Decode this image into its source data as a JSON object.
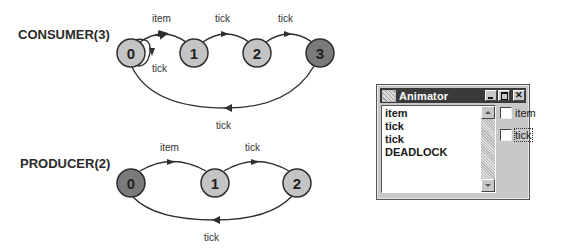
{
  "diagram": {
    "consumer": {
      "label": "CONSUMER(3)",
      "states": [
        {
          "id": "0",
          "fill": "#c4c4c4"
        },
        {
          "id": "1",
          "fill": "#c4c4c4"
        },
        {
          "id": "2",
          "fill": "#c4c4c4"
        },
        {
          "id": "3",
          "fill": "#7a7a7a"
        }
      ],
      "transitions": [
        {
          "from": "0",
          "to": "1",
          "label": "item"
        },
        {
          "from": "1",
          "to": "2",
          "label": "tick"
        },
        {
          "from": "2",
          "to": "3",
          "label": "tick"
        },
        {
          "from": "0",
          "to": "0",
          "label": "tick"
        },
        {
          "from": "3",
          "to": "0",
          "label": "tick"
        }
      ]
    },
    "producer": {
      "label": "PRODUCER(2)",
      "states": [
        {
          "id": "0",
          "fill": "#7a7a7a"
        },
        {
          "id": "1",
          "fill": "#c4c4c4"
        },
        {
          "id": "2",
          "fill": "#c4c4c4"
        }
      ],
      "transitions": [
        {
          "from": "0",
          "to": "1",
          "label": "item"
        },
        {
          "from": "1",
          "to": "2",
          "label": "tick"
        },
        {
          "from": "2",
          "to": "0",
          "label": "tick"
        }
      ]
    }
  },
  "animator": {
    "title": "Animator",
    "trace": [
      "item",
      "tick",
      "tick",
      "DEADLOCK"
    ],
    "actions": [
      {
        "label": "item",
        "checked": false,
        "focused": false
      },
      {
        "label": "tick",
        "checked": false,
        "focused": true
      }
    ]
  }
}
